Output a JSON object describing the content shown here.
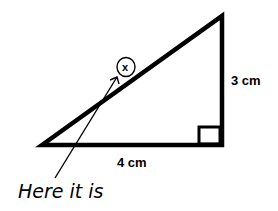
{
  "diagram": {
    "type": "right-triangle",
    "labels": {
      "vertical_side": "3 cm",
      "horizontal_side": "4 cm",
      "unknown": "x"
    },
    "annotation": "Here it is",
    "colors": {
      "stroke": "#000000",
      "background": "#ffffff"
    }
  }
}
